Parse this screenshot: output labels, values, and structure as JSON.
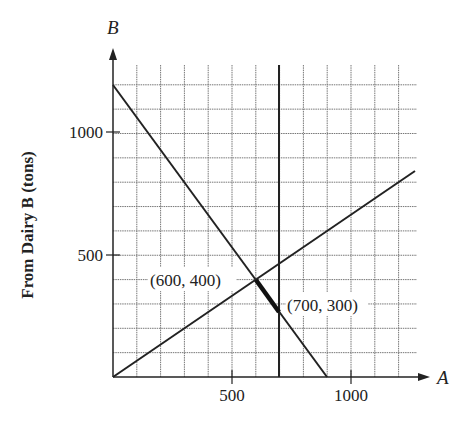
{
  "chart_data": {
    "type": "line",
    "title": "",
    "xlabel": "A",
    "ylabel": "B",
    "y_axis_title": "From Dairy B (tons)",
    "xlim": [
      0,
      1270
    ],
    "ylim": [
      0,
      1270
    ],
    "grid": true,
    "grid_step": 100,
    "x_ticks": [
      500,
      1000
    ],
    "y_ticks": [
      500,
      1000
    ],
    "series": [
      {
        "name": "line1",
        "equation": "B = 1200 - (4/3)A",
        "points": [
          [
            0,
            1200
          ],
          [
            900,
            0
          ]
        ]
      },
      {
        "name": "line2",
        "equation": "B = (2/3)A",
        "points": [
          [
            0,
            0
          ],
          [
            1270,
            847
          ]
        ]
      },
      {
        "name": "line3",
        "equation": "A = 700",
        "points": [
          [
            700,
            0
          ],
          [
            700,
            1270
          ]
        ]
      },
      {
        "name": "feasible-segment",
        "points": [
          [
            600,
            400
          ],
          [
            700,
            266.7
          ]
        ]
      }
    ],
    "annotations": [
      {
        "text": "(600, 400)",
        "point": [
          600,
          400
        ]
      },
      {
        "text": "(700, 300)",
        "point": [
          700,
          300
        ]
      }
    ]
  },
  "labels": {
    "axis_x": "A",
    "axis_y": "B",
    "y_title": "From Dairy B (tons)",
    "tick_x_500": "500",
    "tick_x_1000": "1000",
    "tick_y_500": "500",
    "tick_y_1000": "1000",
    "point1": "(600, 400)",
    "point2": "(700, 300)"
  }
}
